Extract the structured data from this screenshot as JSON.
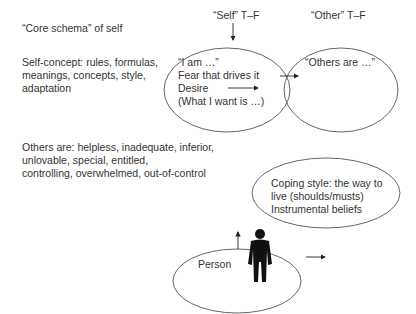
{
  "labels": {
    "core_schema": "“Core schema” of self",
    "self_tf": "“Self” T–F",
    "other_tf": "“Other” T–F",
    "self_concept": [
      "Self-concept: rules, formulas,",
      "meanings, concepts, style,",
      "adaptation"
    ],
    "others_are_list": [
      "Others are: helpless, inadequate, inferior,",
      "unlovable, special, entitled,",
      "controlling, overwhelmed, out-of-control"
    ]
  },
  "ellipses": {
    "self": {
      "lines": [
        "“I am …”",
        "Fear that drives it",
        "Desire",
        "(What I want is …)"
      ]
    },
    "other": {
      "lines": [
        "“Others are …”"
      ]
    },
    "coping": {
      "lines": [
        "Coping style: the way to",
        "live (shoulds/musts)",
        "Instrumental beliefs"
      ]
    },
    "person": {
      "label": "Person",
      "icon": "person-silhouette-icon"
    }
  },
  "colors": {
    "stroke": "#555555",
    "text": "#333333",
    "figure": "#111111"
  }
}
